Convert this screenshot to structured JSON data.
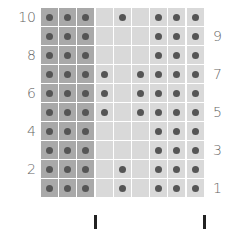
{
  "chart_title": "",
  "colors": {
    "dark_cell": "#a9a9a9",
    "light_cell": "#d9d9d9",
    "dot": "#555555",
    "grid_line": "#ffffff",
    "label": "#666666",
    "marker": "#222222"
  },
  "grid": {
    "columns": 9,
    "rows": 10,
    "dark_columns": [
      1,
      2,
      3
    ]
  },
  "row_labels_left": [
    "10",
    "8",
    "6",
    "4",
    "2"
  ],
  "row_labels_right": [
    "9",
    "7",
    "5",
    "3",
    "1"
  ],
  "rows": [
    {
      "row": 10,
      "dots": [
        1,
        2,
        3,
        5,
        7,
        8,
        9
      ]
    },
    {
      "row": 9,
      "dots": [
        1,
        2,
        3,
        7,
        8,
        9
      ]
    },
    {
      "row": 8,
      "dots": [
        1,
        2,
        3,
        7,
        8,
        9
      ]
    },
    {
      "row": 7,
      "dots": [
        1,
        2,
        3,
        4,
        6,
        7,
        8,
        9
      ]
    },
    {
      "row": 6,
      "dots": [
        1,
        2,
        3,
        4,
        6,
        7,
        8,
        9
      ]
    },
    {
      "row": 5,
      "dots": [
        1,
        2,
        3,
        4,
        6,
        7,
        8,
        9
      ]
    },
    {
      "row": 4,
      "dots": [
        1,
        2,
        3,
        7,
        8,
        9
      ]
    },
    {
      "row": 3,
      "dots": [
        1,
        2,
        3,
        7,
        8,
        9
      ]
    },
    {
      "row": 2,
      "dots": [
        1,
        2,
        3,
        5,
        7,
        8,
        9
      ]
    },
    {
      "row": 1,
      "dots": [
        1,
        2,
        3,
        5,
        7,
        8,
        9
      ]
    }
  ],
  "markers": [
    {
      "after_column": 3
    },
    {
      "after_column": 9
    }
  ]
}
